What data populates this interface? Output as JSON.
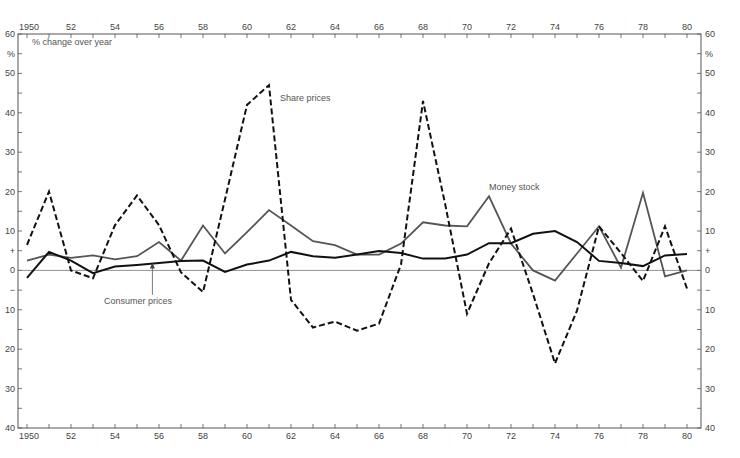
{
  "chart_data": {
    "type": "line",
    "title": "",
    "subtitle": "% change over year",
    "xlabel": "",
    "ylabel": "%",
    "x": [
      1950,
      1951,
      1952,
      1953,
      1954,
      1955,
      1956,
      1957,
      1958,
      1959,
      1960,
      1961,
      1962,
      1963,
      1964,
      1965,
      1966,
      1967,
      1968,
      1969,
      1970,
      1971,
      1972,
      1973,
      1974,
      1975,
      1976,
      1977,
      1978,
      1979,
      1980
    ],
    "xlim": [
      1950,
      1980
    ],
    "ylim": [
      -40,
      60
    ],
    "x_tick_labels": [
      "1950",
      "52",
      "54",
      "56",
      "58",
      "60",
      "62",
      "64",
      "66",
      "68",
      "70",
      "72",
      "74",
      "76",
      "78",
      "80"
    ],
    "y_tick_labels": [
      {
        "value": 60,
        "label": "60"
      },
      {
        "value": 55,
        "label": "%"
      },
      {
        "value": 50,
        "label": "50"
      },
      {
        "value": 40,
        "label": "40"
      },
      {
        "value": 30,
        "label": "30"
      },
      {
        "value": 20,
        "label": "20"
      },
      {
        "value": 10,
        "label": "10"
      },
      {
        "value": 5,
        "label": "+"
      },
      {
        "value": 0,
        "label": "0"
      },
      {
        "value": -5,
        "label": "−"
      },
      {
        "value": -10,
        "label": "10"
      },
      {
        "value": -20,
        "label": "20"
      },
      {
        "value": -30,
        "label": "30"
      },
      {
        "value": -40,
        "label": "40"
      }
    ],
    "grid": false,
    "legend": "inline annotations",
    "series": [
      {
        "name": "Share prices",
        "style": "dashed",
        "color": "#111111",
        "values": [
          6.5,
          20,
          0,
          -2,
          11.5,
          19,
          11.5,
          -0.5,
          -5.5,
          18,
          42,
          47,
          -7.5,
          -14.5,
          -13,
          -15.3,
          -13.5,
          1.5,
          43,
          17,
          -11,
          1.8,
          10.6,
          -6,
          -23.6,
          -10.2,
          11.2,
          4.4,
          -2.7,
          11.2,
          -4.6
        ]
      },
      {
        "name": "Money stock",
        "style": "solid",
        "color": "#555555",
        "values": [
          2.5,
          4,
          3.2,
          3.8,
          2.8,
          3.6,
          7.2,
          2.5,
          11.4,
          4.3,
          9.7,
          15.3,
          11.4,
          7.4,
          6.4,
          4,
          4,
          6.8,
          12.2,
          11.4,
          11.2,
          18.8,
          6.8,
          0,
          -2.6,
          4.3,
          11.2,
          0.7,
          19.7,
          -1.5,
          0
        ]
      },
      {
        "name": "Consumer prices",
        "style": "solid",
        "color": "#111111",
        "values": [
          -1.9,
          4.7,
          2.5,
          -0.7,
          1,
          1.4,
          1.9,
          2.4,
          2.5,
          -0.4,
          1.5,
          2.5,
          4.7,
          3.6,
          3.2,
          4,
          4.9,
          4.4,
          3,
          3,
          4,
          6.9,
          6.9,
          9.3,
          10,
          7.2,
          2.4,
          1.9,
          1.1,
          3.8,
          4.2
        ]
      }
    ],
    "annotations": [
      {
        "text": "Share prices",
        "series": "Share prices",
        "x": 1961.5,
        "y": 43
      },
      {
        "text": "Money stock",
        "series": "Money stock",
        "x": 1971,
        "y": 20.5
      },
      {
        "text": "Consumer prices",
        "series": "Consumer prices",
        "x": 1953.5,
        "y": -8.5,
        "arrow_to": {
          "x": 1955.7,
          "y": 2
        }
      }
    ]
  }
}
